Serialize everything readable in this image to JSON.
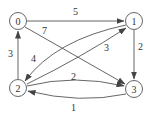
{
  "graph": {
    "type": "directed-weighted",
    "nodes": [
      {
        "id": "0",
        "label": "0",
        "x": 18,
        "y": 21
      },
      {
        "id": "1",
        "label": "1",
        "x": 134,
        "y": 21
      },
      {
        "id": "2",
        "label": "2",
        "x": 18,
        "y": 88
      },
      {
        "id": "3",
        "label": "3",
        "x": 134,
        "y": 89
      }
    ],
    "edges": [
      {
        "from": "0",
        "to": "1",
        "weight": "5"
      },
      {
        "from": "0",
        "to": "3",
        "weight": "7"
      },
      {
        "from": "1",
        "to": "3",
        "weight": "2"
      },
      {
        "from": "1",
        "to": "2",
        "weight": "4"
      },
      {
        "from": "2",
        "to": "1",
        "weight": "3"
      },
      {
        "from": "2",
        "to": "0",
        "weight": "3"
      },
      {
        "from": "2",
        "to": "3",
        "weight": "2"
      },
      {
        "from": "3",
        "to": "2",
        "weight": "1"
      }
    ],
    "colors": {
      "stroke": "#555555",
      "text": "#333333",
      "background": "#ffffff"
    }
  }
}
